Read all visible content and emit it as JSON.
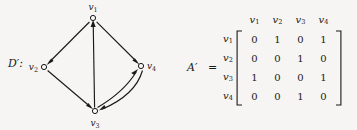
{
  "figure": {
    "background_color": "#f6f5f3",
    "ink_color": "#1a1a1a"
  },
  "digraph": {
    "label": "D′:",
    "vertices": [
      {
        "id": "v1",
        "label": "v",
        "sub": "1",
        "x": 93,
        "y": 18,
        "label_x": 93,
        "label_y": 8
      },
      {
        "id": "v2",
        "label": "v",
        "sub": "2",
        "x": 44,
        "y": 67,
        "label_x": 33,
        "label_y": 70
      },
      {
        "id": "v3",
        "label": "v",
        "sub": "3",
        "x": 95,
        "y": 111,
        "label_x": 95,
        "label_y": 125
      },
      {
        "id": "v4",
        "label": "v",
        "sub": "4",
        "x": 141,
        "y": 66,
        "label_x": 153,
        "label_y": 69
      }
    ],
    "edges": [
      {
        "from": "v1",
        "to": "v2",
        "kind": "straight"
      },
      {
        "from": "v1",
        "to": "v4",
        "kind": "straight"
      },
      {
        "from": "v2",
        "to": "v3",
        "kind": "straight"
      },
      {
        "from": "v3",
        "to": "v1",
        "kind": "straight"
      },
      {
        "from": "v3",
        "to": "v4",
        "kind": "curved"
      },
      {
        "from": "v4",
        "to": "v3",
        "kind": "curved"
      }
    ]
  },
  "matrix": {
    "name": "A′",
    "equals": "=",
    "column_headers": [
      {
        "label": "v",
        "sub": "1"
      },
      {
        "label": "v",
        "sub": "2"
      },
      {
        "label": "v",
        "sub": "3"
      },
      {
        "label": "v",
        "sub": "4"
      }
    ],
    "row_headers": [
      {
        "label": "v",
        "sub": "1"
      },
      {
        "label": "v",
        "sub": "2"
      },
      {
        "label": "v",
        "sub": "3"
      },
      {
        "label": "v",
        "sub": "4"
      }
    ],
    "rows": [
      [
        "0",
        "1",
        "0",
        "1"
      ],
      [
        "0",
        "0",
        "1",
        "0"
      ],
      [
        "1",
        "0",
        "0",
        "1"
      ],
      [
        "0",
        "0",
        "1",
        "0"
      ]
    ]
  }
}
